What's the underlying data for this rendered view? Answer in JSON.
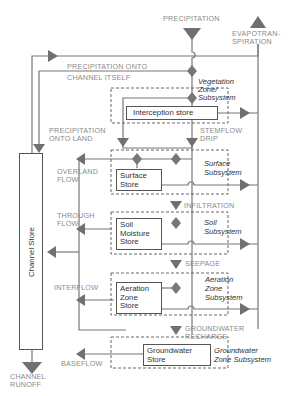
{
  "diagram": {
    "inputs": {
      "precipitation": "PRECIPITATION",
      "evapotranspiration_line1": "EVAPOTRAN-",
      "evapotranspiration_line2": "SPIRATION"
    },
    "flows": {
      "precip_channel_line1": "PRECIPITATION ONTO",
      "precip_channel_line2": "CHANNEL ITSELF",
      "precip_land_line1": "PRECIPITATION",
      "precip_land_line2": "ONTO LAND",
      "stemflow_line1": "STEMFLOW",
      "stemflow_line2": "DRIP",
      "overland_line1": "OVERLAND",
      "overland_line2": "FLOW",
      "infiltration": "INFILTRATION",
      "through_line1": "THROUGH",
      "through_line2": "FLOW",
      "seepage": "SEEPAGE",
      "interflow": "INTERFLOW",
      "gw_recharge_line1": "GROUNDWATER",
      "gw_recharge_line2": "RECHARGE",
      "baseflow": "BASEFLOW",
      "runoff_line1": "CHANNEL",
      "runoff_line2": "RUNOFF"
    },
    "stores": {
      "channel": "Channel Store",
      "interception": "Interception store",
      "surface_line1": "Surface",
      "surface_line2": "Store",
      "soil_line1": "Soil",
      "soil_line2": "Moisture",
      "soil_line3": "Store",
      "aeration_line1": "Aeration",
      "aeration_line2": "Zone",
      "aeration_line3": "Store",
      "groundwater_line1": "Groundwater",
      "groundwater_line2": "Store"
    },
    "subsystems": {
      "vegetation_line1": "Vegetation",
      "vegetation_line2": "Zone/",
      "vegetation_line3": "Subsystem",
      "surface_line1": "Surface",
      "surface_line2": "Subsystem",
      "soil_line1": "Soil",
      "soil_line2": "Subsystem",
      "aeration_line1": "Aeration",
      "aeration_line2": "Zone",
      "aeration_line3": "Subsystem",
      "groundwater_line1": "Groundwater",
      "groundwater_line2": "Zone Subsystem"
    },
    "colors": {
      "line": "#6e6e6e",
      "arrow": "#707070",
      "label": "#8a8a8a",
      "text": "#333333"
    }
  }
}
